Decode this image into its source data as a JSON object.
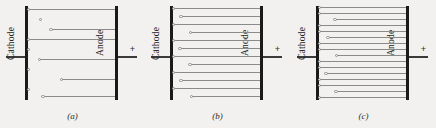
{
  "figure": {
    "background_color": "#f2f1ef",
    "electrode_color": "#1a1a1a",
    "track_color": "#8a8a8a",
    "marker_color": "#8f8f8f"
  },
  "panels": [
    {
      "id": "a",
      "caption": "(a)",
      "cathode_label": "Cathode",
      "anode_label": "Anode",
      "cathode_sign": "–",
      "anode_sign": "+",
      "description": "low current density",
      "markers_only": [
        3,
        13,
        23,
        43,
        53,
        73
      ],
      "tracks": [
        {
          "y": 3,
          "marker_x": 0,
          "length": 100
        },
        {
          "y": 13,
          "marker_x": 14,
          "length": 0
        },
        {
          "y": 23,
          "marker_x": 26,
          "length": 74
        },
        {
          "y": 33,
          "marker_x": 0,
          "length": 100
        },
        {
          "y": 43,
          "marker_x": 0,
          "length": 0
        },
        {
          "y": 53,
          "marker_x": 13,
          "length": 87
        },
        {
          "y": 63,
          "marker_x": 0,
          "length": 0
        },
        {
          "y": 73,
          "marker_x": 38,
          "length": 62
        },
        {
          "y": 83,
          "marker_x": 0,
          "length": 0
        },
        {
          "y": 90,
          "marker_x": 17,
          "length": 83
        }
      ]
    },
    {
      "id": "b",
      "caption": "(b)",
      "cathode_label": "Cathode",
      "anode_label": "Anode",
      "cathode_sign": "–",
      "anode_sign": "+",
      "description": "medium current density",
      "tracks": [
        {
          "y": 2,
          "marker_x": 0,
          "length": 100
        },
        {
          "y": 10,
          "marker_x": 9,
          "length": 91
        },
        {
          "y": 18,
          "marker_x": 0,
          "length": 100
        },
        {
          "y": 26,
          "marker_x": 20,
          "length": 80
        },
        {
          "y": 34,
          "marker_x": 0,
          "length": 100
        },
        {
          "y": 42,
          "marker_x": 8,
          "length": 92
        },
        {
          "y": 50,
          "marker_x": 0,
          "length": 100
        },
        {
          "y": 58,
          "marker_x": 19,
          "length": 81
        },
        {
          "y": 66,
          "marker_x": 0,
          "length": 100
        },
        {
          "y": 74,
          "marker_x": 9,
          "length": 91
        },
        {
          "y": 82,
          "marker_x": 0,
          "length": 100
        },
        {
          "y": 90,
          "marker_x": 21,
          "length": 79
        }
      ]
    },
    {
      "id": "c",
      "caption": "(c)",
      "cathode_label": "Cathode",
      "anode_label": "Anode",
      "cathode_sign": "–",
      "anode_sign": "+",
      "description": "high current density",
      "tracks": [
        {
          "y": 1,
          "marker_x": 0,
          "length": 100
        },
        {
          "y": 7,
          "marker_x": 0,
          "length": 100
        },
        {
          "y": 13,
          "marker_x": 18,
          "length": 82
        },
        {
          "y": 19,
          "marker_x": 0,
          "length": 100
        },
        {
          "y": 25,
          "marker_x": 0,
          "length": 100
        },
        {
          "y": 31,
          "marker_x": 10,
          "length": 90
        },
        {
          "y": 37,
          "marker_x": 0,
          "length": 100
        },
        {
          "y": 43,
          "marker_x": 0,
          "length": 100
        },
        {
          "y": 49,
          "marker_x": 20,
          "length": 80
        },
        {
          "y": 55,
          "marker_x": 0,
          "length": 100
        },
        {
          "y": 61,
          "marker_x": 0,
          "length": 100
        },
        {
          "y": 67,
          "marker_x": 8,
          "length": 92
        },
        {
          "y": 73,
          "marker_x": 0,
          "length": 100
        },
        {
          "y": 79,
          "marker_x": 0,
          "length": 100
        },
        {
          "y": 85,
          "marker_x": 19,
          "length": 81
        },
        {
          "y": 91,
          "marker_x": 0,
          "length": 100
        }
      ]
    }
  ]
}
